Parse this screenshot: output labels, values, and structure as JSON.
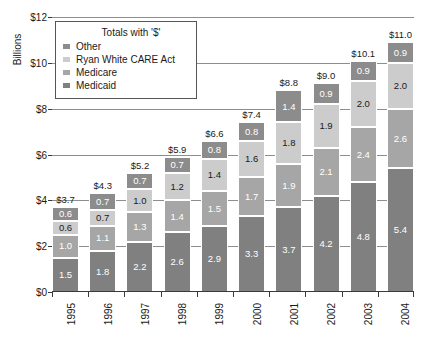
{
  "chart_data": {
    "type": "bar",
    "subtype": "stacked-bar",
    "title": "",
    "xlabel": "",
    "ylabel": "Billions",
    "ylim": [
      0,
      12
    ],
    "ytick_labels": [
      "$0",
      "$2",
      "$4",
      "$6",
      "$8",
      "$10",
      "$12"
    ],
    "ytick_values": [
      0,
      2,
      4,
      6,
      8,
      10,
      12
    ],
    "grid": true,
    "grid_axis": "y",
    "legend_position": "upper-left",
    "legend_title": "Totals with '$'",
    "categories": [
      "1995",
      "1996",
      "1997",
      "1998",
      "1999",
      "2000",
      "2001",
      "2002",
      "2003",
      "2004"
    ],
    "series": [
      {
        "name": "Medicaid",
        "color": "#808080",
        "values": [
          1.5,
          1.8,
          2.2,
          2.6,
          2.9,
          3.3,
          3.7,
          4.2,
          4.8,
          5.4
        ]
      },
      {
        "name": "Medicare",
        "color": "#a6a6a6",
        "values": [
          1.0,
          1.1,
          1.3,
          1.4,
          1.5,
          1.7,
          1.9,
          2.1,
          2.4,
          2.6
        ]
      },
      {
        "name": "Ryan White CARE Act",
        "color": "#cccccc",
        "values": [
          0.6,
          0.7,
          1.0,
          1.2,
          1.4,
          1.6,
          1.8,
          1.9,
          2.0,
          2.0
        ]
      },
      {
        "name": "Other",
        "color": "#8c8c8c",
        "values": [
          0.6,
          0.7,
          0.7,
          0.7,
          0.8,
          0.8,
          1.4,
          0.9,
          0.9,
          0.9
        ]
      }
    ],
    "totals": [
      "$3.7",
      "$4.3",
      "$5.2",
      "$5.9",
      "$6.6",
      "$7.4",
      "$8.8",
      "$9.0",
      "$10.1",
      "$11.0"
    ],
    "totals_numeric": [
      3.7,
      4.3,
      5.2,
      5.9,
      6.6,
      7.4,
      8.8,
      9.0,
      10.1,
      11.0
    ],
    "segment_label_color_dark": "#ffffff",
    "segment_label_color_light": "#1a1a1a"
  },
  "legend": {
    "title": "Totals with '$'",
    "items": [
      {
        "label": "Other",
        "color": "#8c8c8c"
      },
      {
        "label": "Ryan White CARE Act",
        "color": "#cccccc"
      },
      {
        "label": "Medicare",
        "color": "#a6a6a6"
      },
      {
        "label": "Medicaid",
        "color": "#808080"
      }
    ]
  },
  "axis": {
    "y_title": "Billions"
  }
}
